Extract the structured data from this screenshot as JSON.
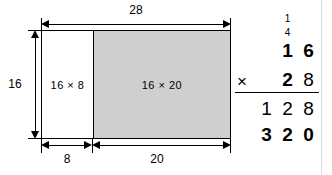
{
  "figure": {
    "colors": {
      "shaded_fill": "#cfcfcf",
      "unshaded_fill": "#ffffff",
      "stroke": "#000000",
      "background": "#ffffff"
    },
    "area_model": {
      "top_dimension": "28",
      "left_dimension": "16",
      "bottom_segments": [
        "8",
        "20"
      ],
      "regions": [
        {
          "label": "16 × 8",
          "shaded": false
        },
        {
          "label": "16 × 20",
          "shaded": true
        }
      ]
    },
    "multiplication": {
      "carries": [
        "1",
        "4"
      ],
      "multiplicand": [
        "1",
        "6"
      ],
      "operator": "×",
      "multiplier": [
        "2",
        "8"
      ],
      "partial_product_1": [
        "1",
        "2",
        "8"
      ],
      "partial_product_2": [
        "3",
        "2",
        "0"
      ]
    }
  }
}
